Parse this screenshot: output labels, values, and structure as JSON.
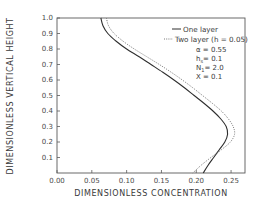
{
  "chart_data": {
    "type": "line",
    "title": "",
    "xlabel": "DIMENSIONLESS CONCENTRATION",
    "ylabel": "DIMENSIONLESS VERTICAL HEIGHT",
    "xlim": [
      0.0,
      0.27
    ],
    "ylim": [
      0.0,
      1.0
    ],
    "x_ticks": [
      "0.00",
      "0.05",
      "0.10",
      "0.15",
      "0.20",
      "0.25"
    ],
    "y_ticks": [
      "0.1",
      "0.2",
      "0.3",
      "0.4",
      "0.5",
      "0.6",
      "0.7",
      "0.8",
      "0.9",
      "1.0"
    ],
    "grid": false,
    "legend_position": "upper right",
    "series": [
      {
        "name": "One layer",
        "style": "solid",
        "points": [
          [
            0.063,
            1.0
          ],
          [
            0.066,
            0.95
          ],
          [
            0.073,
            0.9
          ],
          [
            0.085,
            0.85
          ],
          [
            0.1,
            0.8
          ],
          [
            0.118,
            0.75
          ],
          [
            0.135,
            0.7
          ],
          [
            0.152,
            0.65
          ],
          [
            0.168,
            0.6
          ],
          [
            0.183,
            0.55
          ],
          [
            0.197,
            0.5
          ],
          [
            0.211,
            0.45
          ],
          [
            0.224,
            0.4
          ],
          [
            0.235,
            0.35
          ],
          [
            0.243,
            0.3
          ],
          [
            0.245,
            0.25
          ],
          [
            0.241,
            0.2
          ],
          [
            0.233,
            0.15
          ],
          [
            0.225,
            0.1
          ],
          [
            0.217,
            0.05
          ],
          [
            0.21,
            0.0
          ]
        ]
      },
      {
        "name": "Two layer (h = 0.05)",
        "style": "dotted",
        "points": [
          [
            0.071,
            1.0
          ],
          [
            0.074,
            0.95
          ],
          [
            0.082,
            0.9
          ],
          [
            0.095,
            0.85
          ],
          [
            0.111,
            0.8
          ],
          [
            0.129,
            0.75
          ],
          [
            0.147,
            0.7
          ],
          [
            0.164,
            0.65
          ],
          [
            0.18,
            0.6
          ],
          [
            0.195,
            0.55
          ],
          [
            0.209,
            0.5
          ],
          [
            0.223,
            0.45
          ],
          [
            0.236,
            0.4
          ],
          [
            0.246,
            0.35
          ],
          [
            0.253,
            0.3
          ],
          [
            0.255,
            0.25
          ],
          [
            0.249,
            0.2
          ],
          [
            0.236,
            0.15
          ],
          [
            0.221,
            0.1
          ],
          [
            0.207,
            0.05
          ],
          [
            0.195,
            0.0
          ]
        ]
      }
    ],
    "annotations": [
      "α = 0.55",
      "h_s = 0.1",
      "N_1 = 2.0",
      "X = 0.1"
    ]
  },
  "legend": {
    "items": [
      {
        "label": "One layer",
        "style": "solid"
      },
      {
        "label": "Two layer (h = 0.05)",
        "style": "dotted"
      }
    ]
  },
  "parameters": [
    {
      "label": "α = 0.55"
    },
    {
      "label": "h",
      "sub": "s",
      "value": "= 0.1"
    },
    {
      "label": "N",
      "sub": "1",
      "value": "= 2.0"
    },
    {
      "label": "X = 0.1"
    }
  ],
  "colors": {
    "axis": "#5a5a5a",
    "solid_line": "#2e2e2e",
    "dotted_line": "#6a6a6a"
  }
}
